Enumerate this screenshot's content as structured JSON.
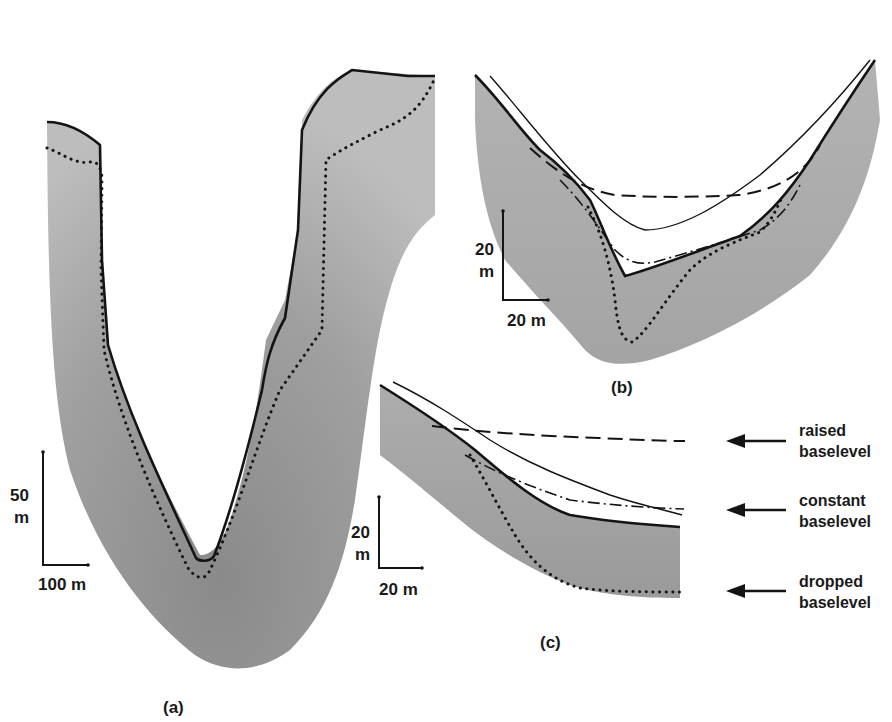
{
  "figure": {
    "panels": [
      {
        "id": "a",
        "label": "(a)",
        "scale_bar": {
          "vertical": "50 m",
          "vertical_value": "50",
          "vertical_unit": "m",
          "horizontal": "100 m"
        }
      },
      {
        "id": "b",
        "label": "(b)",
        "scale_bar": {
          "vertical": "20 m",
          "vertical_value": "20",
          "vertical_unit": "m",
          "horizontal": "20 m"
        }
      },
      {
        "id": "c",
        "label": "(c)",
        "scale_bar": {
          "vertical": "20 m",
          "vertical_value": "20",
          "vertical_unit": "m",
          "horizontal": "20 m"
        }
      }
    ],
    "legend": [
      {
        "line_style": "dashed",
        "label_line1": "raised",
        "label_line2": "baselevel"
      },
      {
        "line_style": "dash-dot",
        "label_line1": "constant",
        "label_line2": "baselevel"
      },
      {
        "line_style": "dotted",
        "label_line1": "dropped",
        "label_line2": "baselevel"
      }
    ],
    "colors": {
      "rock_fill": "#a9a9a9",
      "rock_fill_dark": "#8e8e8e",
      "outline": "#141414",
      "background": "#ffffff"
    }
  }
}
